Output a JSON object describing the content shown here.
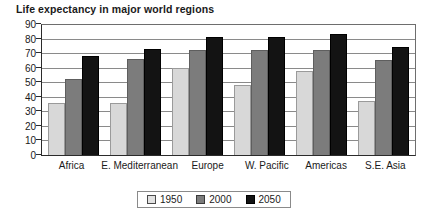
{
  "chart_data": {
    "type": "bar",
    "title": "Life expectancy in major world regions",
    "xlabel": "",
    "ylabel": "",
    "ylim": [
      0,
      90
    ],
    "yticks": [
      0,
      10,
      20,
      30,
      40,
      50,
      60,
      70,
      80,
      90
    ],
    "grid": true,
    "legend_position": "bottom",
    "categories": [
      "Africa",
      "E. Mediterranean",
      "Europe",
      "W. Pacific",
      "Americas",
      "S.E. Asia"
    ],
    "series": [
      {
        "name": "1950",
        "color": "#d8d8d8",
        "values": [
          36,
          36,
          60,
          48,
          58,
          37
        ]
      },
      {
        "name": "2000",
        "color": "#7c7c7c",
        "values": [
          52,
          66,
          72,
          72,
          72,
          65
        ]
      },
      {
        "name": "2050",
        "color": "#131313",
        "values": [
          68,
          73,
          81,
          81,
          83,
          74
        ]
      }
    ]
  }
}
